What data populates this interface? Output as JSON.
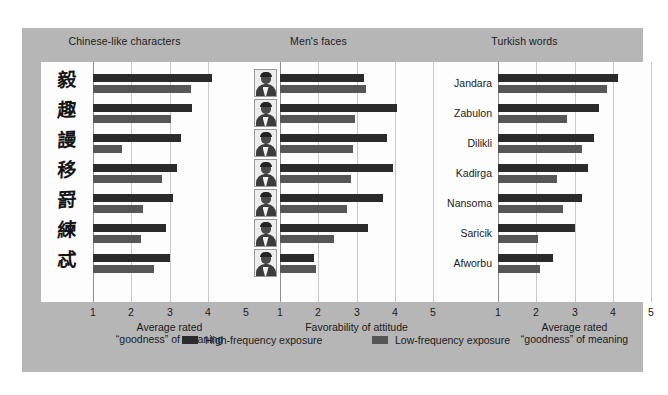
{
  "figure": {
    "background_color": "#b6b6b6",
    "plot_background_color": "#fdfdfd"
  },
  "legend": {
    "items": [
      {
        "label": "High-frequency exposure",
        "color": "#2b2b2b",
        "key": "high"
      },
      {
        "label": "Low-frequency exposure",
        "color": "#565656",
        "key": "low"
      }
    ]
  },
  "chart_data": [
    {
      "type": "bar",
      "title": "Chinese-like characters",
      "orientation": "horizontal",
      "xlabel": "Average rated\n“goodness” of meaning",
      "xlabel_line1": "Average rated",
      "xlabel_line2": "“goodness” of meaning",
      "ylabel": "",
      "xlim": [
        1,
        5
      ],
      "xticks": [
        1,
        2,
        3,
        4,
        5
      ],
      "xticklabels": [
        "1",
        "2",
        "3",
        "4",
        "5"
      ],
      "grid": true,
      "legend_position": "bottom",
      "category_type": "glyph",
      "categories": [
        "毅",
        "趣",
        "謾",
        "移",
        "罸",
        "練",
        "忒"
      ],
      "series": [
        {
          "name": "High-frequency exposure",
          "color": "#2b2b2b",
          "values": [
            4.1,
            3.6,
            3.3,
            3.2,
            3.1,
            2.9,
            3.0
          ]
        },
        {
          "name": "Low-frequency exposure",
          "color": "#565656",
          "values": [
            3.55,
            3.05,
            1.75,
            2.8,
            2.3,
            2.25,
            2.6
          ]
        }
      ]
    },
    {
      "type": "bar",
      "title": "Men's faces",
      "orientation": "horizontal",
      "xlabel": "Favorability of attitude",
      "xlabel_line1": "Favorability of attitude",
      "xlabel_line2": "",
      "ylabel": "",
      "xlim": [
        1,
        5
      ],
      "xticks": [
        1,
        2,
        3,
        4,
        5
      ],
      "xticklabels": [
        "1",
        "2",
        "3",
        "4",
        "5"
      ],
      "grid": true,
      "legend_position": "bottom",
      "category_type": "face",
      "categories": [
        "face-1",
        "face-2",
        "face-3",
        "face-4",
        "face-5",
        "face-6",
        "face-7"
      ],
      "series": [
        {
          "name": "High-frequency exposure",
          "color": "#2b2b2b",
          "values": [
            3.2,
            4.05,
            3.8,
            3.95,
            3.7,
            3.3,
            1.9
          ]
        },
        {
          "name": "Low-frequency exposure",
          "color": "#565656",
          "values": [
            3.25,
            2.95,
            2.9,
            2.85,
            2.75,
            2.4,
            1.95
          ]
        }
      ]
    },
    {
      "type": "bar",
      "title": "Turkish words",
      "orientation": "horizontal",
      "xlabel": "Average rated\n“goodness” of meaning",
      "xlabel_line1": "Average rated",
      "xlabel_line2": "“goodness” of meaning",
      "ylabel": "",
      "xlim": [
        1,
        5
      ],
      "xticks": [
        1,
        2,
        3,
        4,
        5
      ],
      "xticklabels": [
        "1",
        "2",
        "3",
        "4",
        "5"
      ],
      "grid": true,
      "legend_position": "bottom",
      "category_type": "word",
      "categories": [
        "Jandara",
        "Zabulon",
        "Dilikli",
        "Kadirga",
        "Nansoma",
        "Saricik",
        "Afworbu"
      ],
      "series": [
        {
          "name": "High-frequency exposure",
          "color": "#2b2b2b",
          "values": [
            4.15,
            3.65,
            3.5,
            3.35,
            3.2,
            3.0,
            2.45
          ]
        },
        {
          "name": "Low-frequency exposure",
          "color": "#565656",
          "values": [
            3.85,
            2.8,
            3.2,
            2.55,
            2.7,
            2.05,
            2.1
          ]
        }
      ]
    }
  ]
}
